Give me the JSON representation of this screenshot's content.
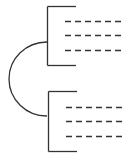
{
  "diagram": {
    "type": "bracket-pair-connected-by-arc",
    "stroke_color": "#333333",
    "background": "#ffffff",
    "top_group": {
      "placeholder_lines": 3
    },
    "bottom_group": {
      "placeholder_lines": 3
    }
  }
}
